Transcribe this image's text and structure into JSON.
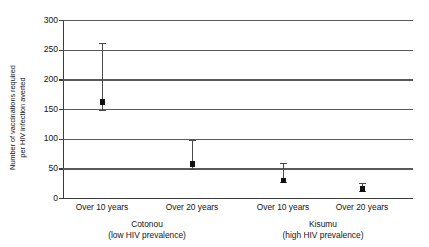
{
  "chart_data": {
    "type": "scatter",
    "title": "",
    "xlabel": "",
    "ylabel": "Number of vaccinations required per HIV infection averted",
    "ylabel_lines": [
      "Number of vaccinations required",
      "per HIV infection averted"
    ],
    "ylim": [
      0,
      300
    ],
    "yticks": [
      0,
      50,
      100,
      150,
      200,
      250,
      300
    ],
    "ytick_labels": [
      "0",
      "50",
      "100",
      "150",
      "200",
      "250",
      "300"
    ],
    "grid": true,
    "grid_axis": "y",
    "legend": false,
    "categories": [
      "Over 10 years",
      "Over 20 years",
      "Over 10 years",
      "Over 20 years"
    ],
    "groups": [
      {
        "name": "Cotonou",
        "qualifier": "(low HIV prevalence)",
        "categories": [
          "Over 10 years",
          "Over 20 years"
        ]
      },
      {
        "name": "Kisumu",
        "qualifier": "(high HIV prevalence)",
        "categories": [
          "Over 10 years",
          "Over 20 years"
        ]
      }
    ],
    "points": [
      {
        "group": "Cotonou",
        "category": "Over 10 years",
        "value": 162,
        "low": 147,
        "high": 262,
        "x_px": 102
      },
      {
        "group": "Cotonou",
        "category": "Over 20 years",
        "value": 57,
        "low": 47,
        "high": 98,
        "x_px": 192
      },
      {
        "group": "Kisumu",
        "category": "Over 10 years",
        "value": 30,
        "low": 25,
        "high": 59,
        "x_px": 283
      },
      {
        "group": "Kisumu",
        "category": "Over 20 years",
        "value": 15,
        "low": 10,
        "high": 25,
        "x_px": 362
      }
    ],
    "series": [
      {
        "name": "Number of vaccinations required per HIV infection averted",
        "values": [
          162,
          57,
          30,
          15
        ],
        "lower": [
          147,
          47,
          25,
          10
        ],
        "upper": [
          262,
          98,
          59,
          25
        ]
      }
    ],
    "colors": {
      "marker": "#111111",
      "errorbar": "#4a4a4a",
      "gridline": "#5a5a5a",
      "axis": "#3b3b3b",
      "text": "#141414",
      "background": "#ffffff"
    }
  }
}
